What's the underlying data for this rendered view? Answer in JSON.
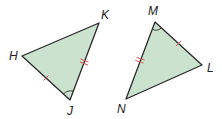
{
  "diagram": {
    "fill_color": "#cbe2cf",
    "stroke_color": "#2a2a2a",
    "mark_color": "#d9534f",
    "triangles": [
      {
        "name": "HJK",
        "vertices": [
          {
            "label": "H",
            "x": 22,
            "y": 56,
            "lx": 9,
            "ly": 60
          },
          {
            "label": "K",
            "x": 99,
            "y": 23,
            "lx": 101,
            "ly": 19
          },
          {
            "label": "J",
            "x": 70,
            "y": 100,
            "lx": 67,
            "ly": 115
          }
        ],
        "marks": {
          "single_tick_side": "HJ",
          "double_tick_side": "KJ",
          "angle_arc_vertex": "J"
        }
      },
      {
        "name": "LMN",
        "vertices": [
          {
            "label": "M",
            "x": 155,
            "y": 22,
            "lx": 148,
            "ly": 15
          },
          {
            "label": "L",
            "x": 202,
            "y": 65,
            "lx": 207,
            "ly": 72
          },
          {
            "label": "N",
            "x": 126,
            "y": 99,
            "lx": 117,
            "ly": 113
          }
        ],
        "marks": {
          "single_tick_side": "ML",
          "double_tick_side": "MN",
          "angle_arc_vertex": "M"
        }
      }
    ]
  }
}
